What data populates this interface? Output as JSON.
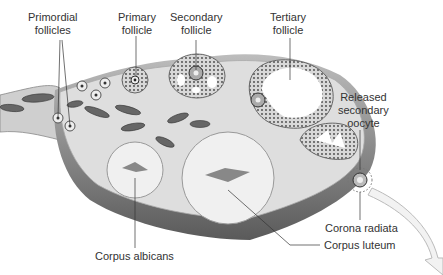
{
  "colors": {
    "stroma": "#dcdcdc",
    "outer_capsule": "#6a6a6a",
    "follicle_cells": "#cfcfcf",
    "antrum": "#ffffff",
    "vessel": "#555555",
    "line": "#333333"
  },
  "labels": {
    "primordial": [
      "Primordial",
      "follicles"
    ],
    "primary": [
      "Primary",
      "follicle"
    ],
    "secondary": [
      "Secondary",
      "follicle"
    ],
    "tertiary": [
      "Tertiary",
      "follicle"
    ],
    "released": [
      "Released",
      "secondary",
      "oocyte"
    ],
    "corona": "Corona radiata",
    "luteum": "Corpus luteum",
    "albicans": "Corpus albicans"
  }
}
